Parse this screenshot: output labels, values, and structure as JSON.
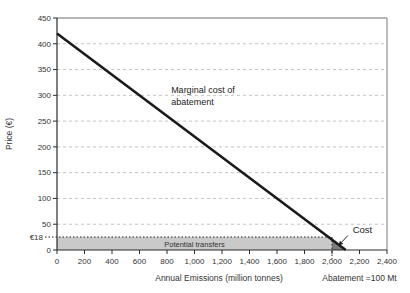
{
  "figure": {
    "background": "#ffffff",
    "colors": {
      "line": "#1a1a1a",
      "grid": "#c4c4c4",
      "band_fill": "#c9c9c9",
      "triangle_fill": "#7d7d7d",
      "axis": "#2b2b2b",
      "frame": "#9e9e9e",
      "text": "#333333"
    }
  },
  "chart_data": {
    "type": "line",
    "title": "",
    "xlabel": "Annual Emissions (million tonnes)",
    "ylabel": "Price (€)",
    "xlim": [
      0,
      2400
    ],
    "ylim": [
      0,
      450
    ],
    "grid": "horizontal dashed",
    "legend": "none",
    "x_ticks": {
      "values": [
        0,
        200,
        400,
        600,
        800,
        1000,
        1200,
        1400,
        1600,
        1800,
        2000,
        2200,
        2400
      ],
      "labels": [
        "0",
        "200",
        "400",
        "600",
        "800",
        "1,000",
        "1,200",
        "1,400",
        "1,600",
        "1,800",
        "2,000",
        "2,200",
        "2,400"
      ]
    },
    "y_ticks": {
      "values": [
        0,
        50,
        100,
        150,
        200,
        250,
        300,
        350,
        400,
        450
      ],
      "labels": [
        "0",
        "50",
        "100",
        "150",
        "200",
        "250",
        "300",
        "350",
        "400",
        "450"
      ]
    },
    "price_marker": {
      "label": "€18",
      "value": 18
    },
    "series": [
      {
        "name": "Marginal cost of abatement",
        "color": "#1a1a1a",
        "points": [
          [
            0,
            420
          ],
          [
            2100,
            0
          ]
        ]
      }
    ],
    "regions": [
      {
        "name": "potential-transfers",
        "label": "Potential transfers",
        "x_range": [
          0,
          2000
        ],
        "y_range": [
          0,
          18
        ],
        "fill": "#c9c9c9",
        "top_border": "dotted",
        "label_anchor": [
          1000,
          9
        ]
      },
      {
        "name": "cost-triangle",
        "label": "Cost",
        "vertices": [
          [
            2000,
            20
          ],
          [
            2000,
            0
          ],
          [
            2100,
            0
          ]
        ],
        "fill": "#7d7d7d"
      }
    ],
    "reference_lines": [
      {
        "name": "abatement-vline",
        "x": 2000,
        "style": "dotted",
        "y_range": [
          0,
          20
        ]
      }
    ],
    "annotations": [
      {
        "name": "marginal-cost-label",
        "text_lines": [
          "Marginal cost of",
          "abatement"
        ],
        "anchor": [
          830,
          305
        ]
      },
      {
        "name": "cost-label",
        "text": "Cost",
        "anchor": [
          2150,
          38
        ],
        "arrow_from": [
          2115,
          28
        ],
        "arrow_to": [
          2045,
          8
        ]
      },
      {
        "name": "abatement-label",
        "text": "Abatement =100 Mt",
        "anchor_x": 2200,
        "below_axis": true
      }
    ]
  }
}
